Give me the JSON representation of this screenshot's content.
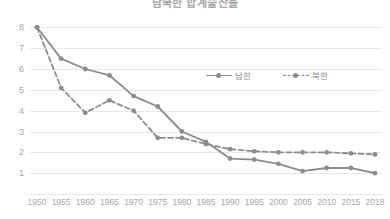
{
  "title": "남북한 합계출산율",
  "legend": {
    "position": "inside-top-center",
    "items": [
      {
        "label": "남한",
        "style": "solid",
        "color": "#8c8c8c"
      },
      {
        "label": "북한",
        "style": "dashed",
        "color": "#8c8c8c"
      }
    ]
  },
  "chart_data": {
    "type": "line",
    "title": "남북한 합계출산율",
    "xlabel": "",
    "ylabel": "",
    "categories": [
      "1950",
      "1955",
      "1960",
      "1965",
      "1970",
      "1975",
      "1980",
      "1985",
      "1990",
      "1995",
      "2000",
      "2005",
      "2010",
      "2015",
      "2018"
    ],
    "ylim": [
      0,
      8.4
    ],
    "yticks": [
      1,
      2,
      3,
      4,
      5,
      6,
      7,
      8
    ],
    "ytick_labels": [
      "1",
      "2",
      "3",
      "4",
      "5",
      "6",
      "7",
      "8"
    ],
    "grid": true,
    "series": [
      {
        "name": "남한",
        "style": "solid",
        "color": "#8c8c8c",
        "values": [
          8.0,
          6.5,
          6.0,
          5.7,
          4.7,
          4.2,
          3.0,
          2.5,
          1.7,
          1.65,
          1.45,
          1.1,
          1.25,
          1.25,
          1.0
        ]
      },
      {
        "name": "북한",
        "style": "dashed",
        "color": "#8c8c8c",
        "values": [
          8.0,
          5.1,
          3.9,
          4.5,
          4.0,
          2.7,
          2.7,
          2.4,
          2.15,
          2.05,
          2.0,
          2.0,
          2.0,
          1.95,
          1.9
        ]
      }
    ]
  },
  "axis": {
    "ytick_labels": [
      "8",
      "7",
      "6",
      "5",
      "4",
      "3",
      "2",
      "1"
    ],
    "xtick_labels": [
      "1950",
      "1955",
      "1960",
      "1965",
      "1970",
      "1975",
      "1980",
      "1985",
      "1990",
      "1995",
      "2000",
      "2005",
      "2010",
      "2015",
      "2018"
    ]
  },
  "colors": {
    "line": "#8c8c8c",
    "grid": "#e8e8e8",
    "tick_text": "#a6a6a6",
    "title_text": "#a9a9a9",
    "background": "#ffffff"
  }
}
